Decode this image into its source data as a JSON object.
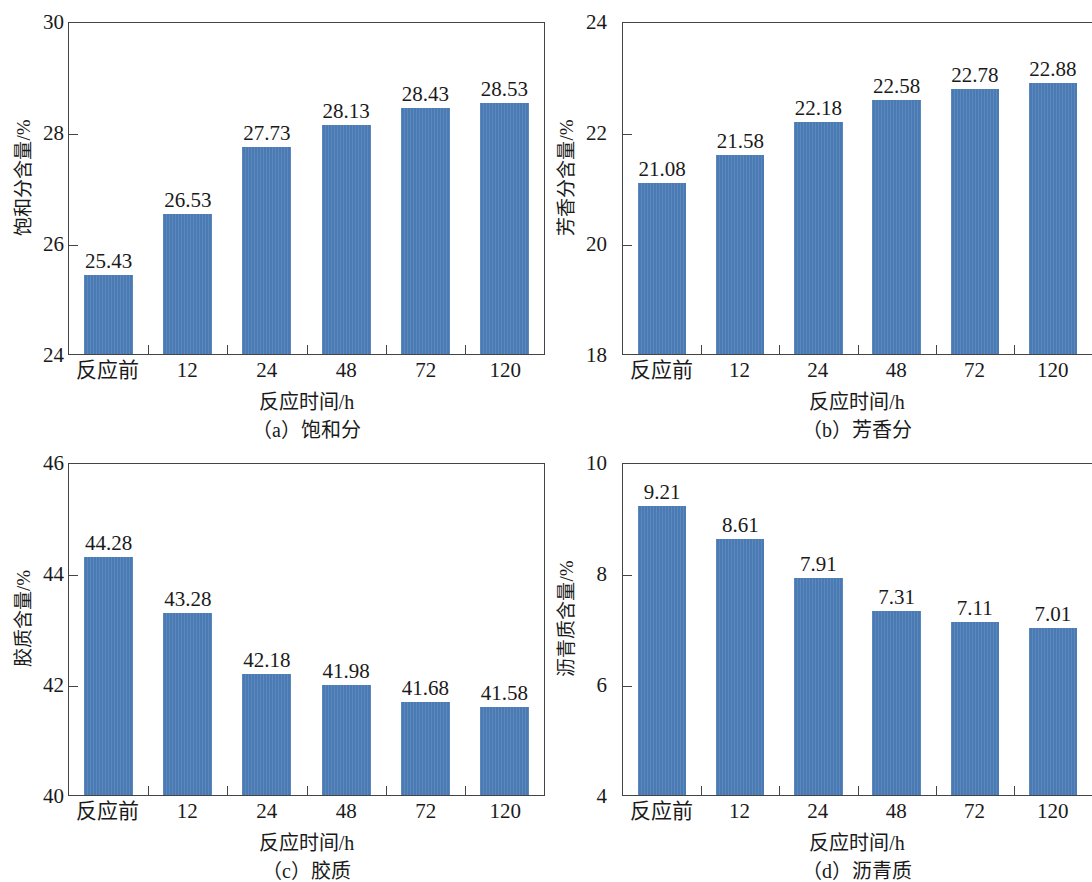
{
  "colors": {
    "bar": "#4a7ab4",
    "axis": "#444444",
    "text": "#1a1a1a",
    "background": "#ffffff"
  },
  "figure": {
    "panel_count": 4,
    "shared_xlabel": "反应时间/h",
    "shared_categories": [
      "反应前",
      "12",
      "24",
      "48",
      "72",
      "120"
    ]
  },
  "chart_data": [
    {
      "id": "a",
      "type": "bar",
      "title": "",
      "caption": "（a）饱和分",
      "xlabel": "反应时间/h",
      "ylabel": "饱和分含量/%",
      "categories": [
        "反应前",
        "12",
        "24",
        "48",
        "72",
        "120"
      ],
      "values": [
        25.43,
        26.53,
        27.73,
        28.13,
        28.43,
        28.53
      ],
      "value_labels": [
        "25.43",
        "26.53",
        "27.73",
        "28.13",
        "28.43",
        "28.53"
      ],
      "ylim": [
        24,
        30
      ],
      "yticks": [
        30,
        28,
        26,
        24
      ],
      "ytick_labels": [
        "30",
        "28",
        "26",
        "24"
      ],
      "grid": false,
      "legend": "none"
    },
    {
      "id": "b",
      "type": "bar",
      "title": "",
      "caption": "（b）芳香分",
      "xlabel": "反应时间/h",
      "ylabel": "芳香分含量/%",
      "categories": [
        "反应前",
        "12",
        "24",
        "48",
        "72",
        "120"
      ],
      "values": [
        21.08,
        21.58,
        22.18,
        22.58,
        22.78,
        22.88
      ],
      "value_labels": [
        "21.08",
        "21.58",
        "22.18",
        "22.58",
        "22.78",
        "22.88"
      ],
      "ylim": [
        18,
        24
      ],
      "yticks": [
        24,
        22,
        20,
        18
      ],
      "ytick_labels": [
        "24",
        "22",
        "20",
        "18"
      ],
      "grid": false,
      "legend": "none"
    },
    {
      "id": "c",
      "type": "bar",
      "title": "",
      "caption": "（c）胶质",
      "xlabel": "反应时间/h",
      "ylabel": "胶质含量/%",
      "categories": [
        "反应前",
        "12",
        "24",
        "48",
        "72",
        "120"
      ],
      "values": [
        44.28,
        43.28,
        42.18,
        41.98,
        41.68,
        41.58
      ],
      "value_labels": [
        "44.28",
        "43.28",
        "42.18",
        "41.98",
        "41.68",
        "41.58"
      ],
      "ylim": [
        40,
        46
      ],
      "yticks": [
        46,
        44,
        42,
        40
      ],
      "ytick_labels": [
        "46",
        "44",
        "42",
        "40"
      ],
      "grid": false,
      "legend": "none"
    },
    {
      "id": "d",
      "type": "bar",
      "title": "",
      "caption": "（d）沥青质",
      "xlabel": "反应时间/h",
      "ylabel": "沥青质含量/%",
      "categories": [
        "反应前",
        "12",
        "24",
        "48",
        "72",
        "120"
      ],
      "values": [
        9.21,
        8.61,
        7.91,
        7.31,
        7.11,
        7.01
      ],
      "value_labels": [
        "9.21",
        "8.61",
        "7.91",
        "7.31",
        "7.11",
        "7.01"
      ],
      "ylim": [
        4,
        10
      ],
      "yticks": [
        10,
        8,
        6,
        4
      ],
      "ytick_labels": [
        "10",
        "8",
        "6",
        "4"
      ],
      "grid": false,
      "legend": "none"
    }
  ]
}
